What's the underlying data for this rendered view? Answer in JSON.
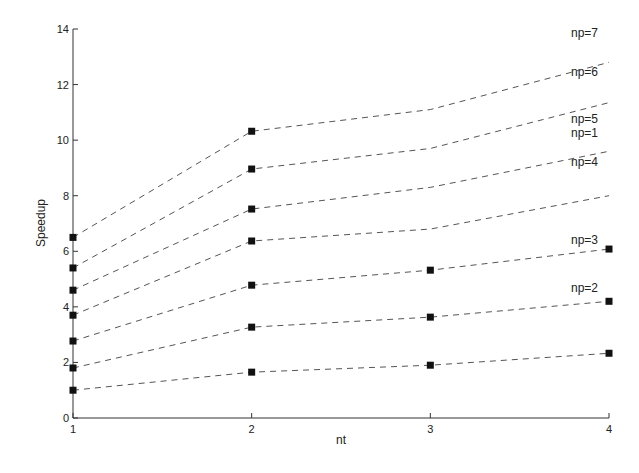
{
  "chart_data": {
    "type": "line",
    "title": "",
    "xlabel": "nt",
    "ylabel": "Speedup",
    "x": [
      1,
      2,
      3,
      4
    ],
    "xticks": [
      "1",
      "2",
      "3",
      "4"
    ],
    "yticks": [
      "0",
      "2",
      "4",
      "6",
      "8",
      "10",
      "12",
      "14"
    ],
    "xlim": [
      1,
      4
    ],
    "ylim": [
      0,
      14
    ],
    "grid": false,
    "legend_position": "inline-right",
    "line_style": "dashed",
    "marker": "square",
    "series": [
      {
        "name": "np=1",
        "values": [
          1.0,
          1.65,
          1.9,
          2.33
        ],
        "markers": [
          true,
          true,
          true,
          true
        ],
        "label_y": 10.25
      },
      {
        "name": "np=2",
        "values": [
          1.8,
          3.27,
          3.63,
          4.2
        ],
        "markers": [
          true,
          true,
          true,
          true
        ],
        "label_y": 4.68
      },
      {
        "name": "np=3",
        "values": [
          2.77,
          4.78,
          5.32,
          6.08
        ],
        "markers": [
          true,
          true,
          true,
          true
        ],
        "label_y": 6.4
      },
      {
        "name": "np=4",
        "values": [
          3.7,
          6.37,
          6.8,
          8.0
        ],
        "markers": [
          true,
          true,
          false,
          false
        ],
        "label_y": 9.2
      },
      {
        "name": "np=5",
        "values": [
          4.6,
          7.52,
          8.3,
          9.6
        ],
        "markers": [
          true,
          true,
          false,
          false
        ],
        "label_y": 10.75
      },
      {
        "name": "np=6",
        "values": [
          5.4,
          8.96,
          9.7,
          11.35
        ],
        "markers": [
          true,
          true,
          false,
          false
        ],
        "label_y": 12.45
      },
      {
        "name": "np=7",
        "values": [
          6.5,
          10.32,
          11.1,
          12.8
        ],
        "markers": [
          true,
          true,
          false,
          false
        ],
        "label_y": 13.85
      }
    ]
  },
  "colors": {
    "line": "#555555",
    "marker": "#111111",
    "axis": "#333333",
    "background": "#ffffff"
  }
}
